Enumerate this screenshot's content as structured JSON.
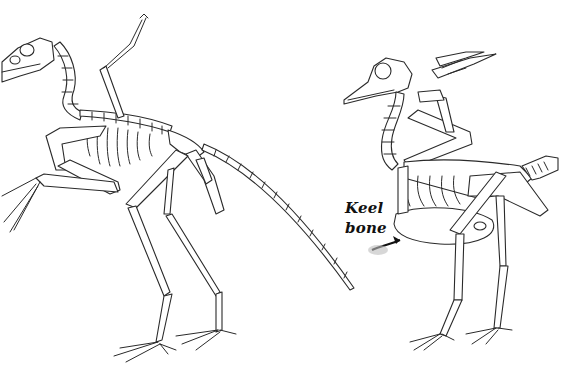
{
  "figure": {
    "background_color": "#ffffff",
    "line_color": "#2a2a2a",
    "panels": [
      {
        "name": "dinosaur-skeleton",
        "position": "left"
      },
      {
        "name": "bird-skeleton",
        "position": "right"
      }
    ],
    "annotation": {
      "line1": "Keel",
      "line2": "bone",
      "arrow": "points to bird sternum"
    }
  }
}
